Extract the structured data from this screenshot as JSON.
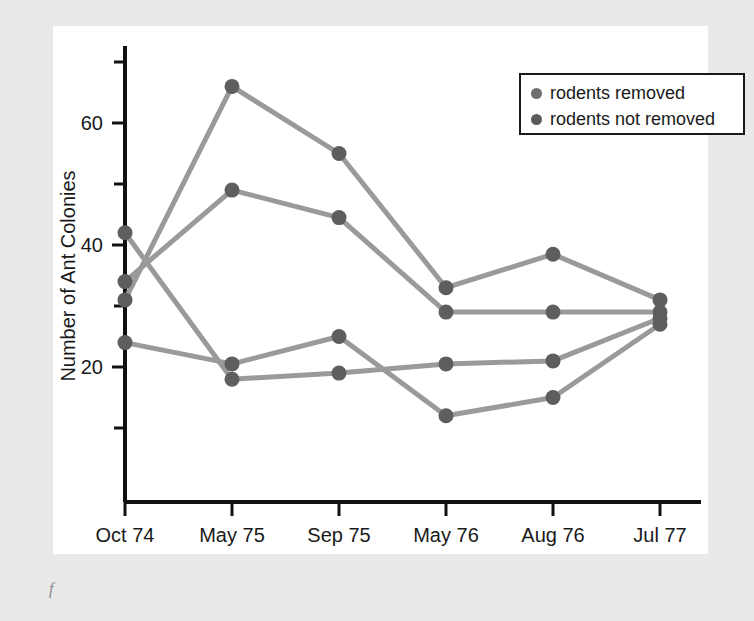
{
  "figure": {
    "caption_mark": "f"
  },
  "legend": {
    "position": "top-right",
    "items": [
      {
        "label": "rodents removed",
        "color": "#6f6f6f"
      },
      {
        "label": "rodents not removed",
        "color": "#5a5a5a"
      }
    ]
  },
  "chart_data": {
    "type": "line",
    "title": "",
    "xlabel": "Sampling Periods",
    "ylabel": "Number of Ant Colonies",
    "categories": [
      "Oct 74",
      "May 75",
      "Sep 75",
      "May 76",
      "Aug 76",
      "Jul 77"
    ],
    "ylim": [
      0,
      72
    ],
    "yticks_major": [
      20,
      40,
      60
    ],
    "yticks_minor": [
      10,
      30,
      50,
      70
    ],
    "ytick_labels": [
      "20",
      "40",
      "60"
    ],
    "grid": false,
    "legend_position": "top-right",
    "series": [
      {
        "name": "rodents removed (plot 1)",
        "group": "rodents removed",
        "color": "#9a9a9a",
        "point_color": "#5e5e5e",
        "values": [
          31,
          66,
          55,
          33,
          38.5,
          31
        ]
      },
      {
        "name": "rodents removed (plot 2)",
        "group": "rodents removed",
        "color": "#9a9a9a",
        "point_color": "#5e5e5e",
        "values": [
          34,
          49,
          44.5,
          29,
          29,
          29
        ]
      },
      {
        "name": "rodents not removed (plot 1)",
        "group": "rodents not removed",
        "color": "#9a9a9a",
        "point_color": "#5e5e5e",
        "values": [
          42,
          18,
          19,
          20.5,
          21,
          28
        ]
      },
      {
        "name": "rodents not removed (plot 2)",
        "group": "rodents not removed",
        "color": "#9a9a9a",
        "point_color": "#5e5e5e",
        "values": [
          24,
          20.5,
          25,
          12,
          15,
          27
        ]
      }
    ]
  }
}
